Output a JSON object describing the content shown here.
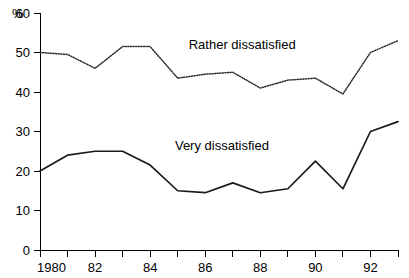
{
  "chart_data": {
    "type": "line",
    "title": "",
    "xlabel": "",
    "ylabel": "%",
    "ylim": [
      0,
      60
    ],
    "xlim": [
      1980,
      1993
    ],
    "grid": false,
    "legend_position": "inline-annotation",
    "x": [
      1980,
      1981,
      1982,
      1983,
      1984,
      1985,
      1986,
      1987,
      1988,
      1989,
      1990,
      1991,
      1992,
      1993
    ],
    "xtick_values": [
      1980,
      1981,
      1982,
      1983,
      1984,
      1985,
      1986,
      1987,
      1988,
      1989,
      1990,
      1991,
      1992,
      1993
    ],
    "xtick_labels": [
      "1980",
      "",
      "82",
      "",
      "84",
      "",
      "86",
      "",
      "88",
      "",
      "90",
      "",
      "92",
      ""
    ],
    "ytick_values": [
      0,
      10,
      20,
      30,
      40,
      50,
      60
    ],
    "ytick_labels": [
      "0",
      "10",
      "20",
      "30",
      "40",
      "50",
      "60"
    ],
    "series": [
      {
        "name": "Rather dissatisfied",
        "style": "dotted",
        "color": "#2b2b2b",
        "label_x": 1985.4,
        "label_y": 51.0,
        "values": [
          50.0,
          49.5,
          46.0,
          51.5,
          51.5,
          43.5,
          44.5,
          45.0,
          41.0,
          43.0,
          43.5,
          39.5,
          50.0,
          53.0
        ]
      },
      {
        "name": "Very dissatisfied",
        "style": "solid",
        "color": "#1a1a1a",
        "label_x": 1984.9,
        "label_y": 25.4,
        "values": [
          20.0,
          24.0,
          25.0,
          25.0,
          21.5,
          15.0,
          14.5,
          17.0,
          14.5,
          15.5,
          22.5,
          15.5,
          30.0,
          32.5
        ]
      }
    ]
  },
  "axis": {
    "unit_label": "%"
  }
}
